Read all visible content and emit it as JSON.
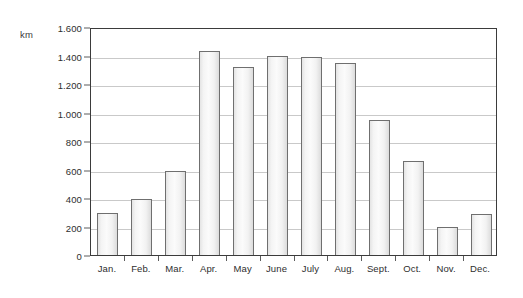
{
  "chart_data": {
    "type": "bar",
    "title": "",
    "subtitle": "",
    "xlabel": "",
    "ylabel": "km",
    "unit_label": "km",
    "categories": [
      "Jan.",
      "Feb.",
      "Mar.",
      "Apr.",
      "May",
      "June",
      "July",
      "Aug.",
      "Sept.",
      "Oct.",
      "Nov.",
      "Dec."
    ],
    "values": [
      295,
      395,
      590,
      1430,
      1320,
      1400,
      1390,
      1345,
      945,
      660,
      195,
      285
    ],
    "ylim": [
      0,
      1600
    ],
    "ytick_values": [
      0,
      200,
      400,
      600,
      800,
      1000,
      1200,
      1400,
      1600
    ],
    "ytick_labels": [
      "0",
      "200",
      "400",
      "600",
      "800",
      "1.000",
      "1.200",
      "1.400",
      "1.600"
    ],
    "grid": true,
    "grid_axis": "y",
    "legend": false,
    "legend_position": "none",
    "bar_fill_color": "#f4f4f4",
    "bar_border_color": "#6f6f6f",
    "gridline_color": "#c9c9c9",
    "frame_color": "#3b3b3b",
    "background_color": "#ffffff",
    "text_color": "#2e2e2e"
  }
}
